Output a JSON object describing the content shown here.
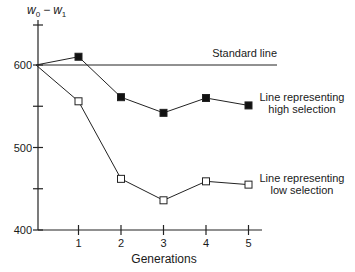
{
  "chart_data": {
    "type": "line",
    "title": "",
    "ylabel": "w0 − w1",
    "ylabel_parts": {
      "a": "w",
      "a_sub": "0",
      "dash": "−",
      "b": "w",
      "b_sub": "1"
    },
    "xlabel": "Generations",
    "x": [
      0,
      1,
      2,
      3,
      4,
      5
    ],
    "x_tick_labels": [
      "1",
      "2",
      "3",
      "4",
      "5"
    ],
    "y_tick_labels": [
      "400",
      "500",
      "600"
    ],
    "y_ticks": [
      400,
      450,
      500,
      550,
      600
    ],
    "ylim": [
      400,
      620
    ],
    "grid": false,
    "reference_line": {
      "name": "Standard line",
      "value": 600
    },
    "series": [
      {
        "name": "Line representing high selection",
        "marker": "filled-square",
        "values": [
          600,
          610,
          561,
          542,
          560,
          551
        ]
      },
      {
        "name": "Line representing low selection",
        "marker": "open-square",
        "values": [
          600,
          556,
          462,
          436,
          459,
          455
        ]
      }
    ],
    "annotations": {
      "standard": "Standard line",
      "high_1": "Line representing",
      "high_2": "high selection",
      "low_1": "Line representing",
      "low_2": "low selection"
    }
  }
}
